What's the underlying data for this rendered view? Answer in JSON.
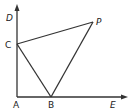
{
  "diagram": {
    "points": {
      "A": {
        "label": "A",
        "x": 17,
        "y": 97
      },
      "B": {
        "label": "B",
        "x": 51,
        "y": 97
      },
      "C": {
        "label": "C",
        "x": 17,
        "y": 44
      },
      "D": {
        "label": "D"
      },
      "E": {
        "label": "E"
      },
      "P": {
        "label": "P",
        "x": 93,
        "y": 22
      }
    },
    "segments": [
      "AD (ray, arrow)",
      "AE (ray, arrow)",
      "CP",
      "CB",
      "BP"
    ],
    "stroke_color": "#333333"
  }
}
